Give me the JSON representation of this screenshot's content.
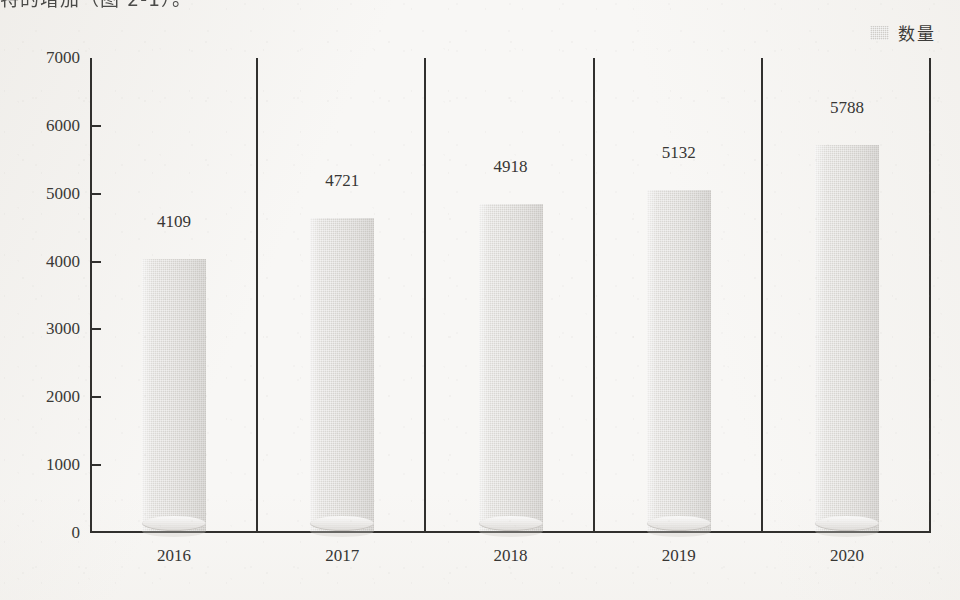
{
  "page": {
    "cut_off_heading": "特的增加（图 2-1）。",
    "background_color": "#f8f7f5"
  },
  "legend": {
    "swatch_icon": "legend-swatch-icon",
    "label": "数量",
    "color": "#cfcdc9"
  },
  "chart_data": {
    "type": "bar",
    "title": "",
    "subtitle": "",
    "xlabel": "",
    "ylabel": "",
    "categories": [
      "2016",
      "2017",
      "2018",
      "2019",
      "2020"
    ],
    "values": [
      4109,
      4721,
      4918,
      5132,
      5788
    ],
    "series": [
      {
        "name": "数量",
        "values": [
          4109,
          4721,
          4918,
          5132,
          5788
        ]
      }
    ],
    "data_labels": [
      "4109",
      "4721",
      "4918",
      "5132",
      "5788"
    ],
    "ylim": [
      0,
      7000
    ],
    "ytick_step": 1000,
    "yticks": [
      "0",
      "1000",
      "2000",
      "3000",
      "4000",
      "5000",
      "6000",
      "7000"
    ],
    "grid": false,
    "legend_position": "top-right",
    "bar_style": "cylinder",
    "bar_color": "#d6d4d0",
    "axis_color": "#31302e",
    "category_separators": true
  }
}
